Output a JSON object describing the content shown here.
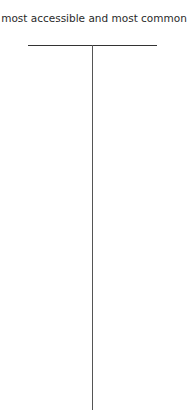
{
  "diagram": {
    "top_label": "most accessible and most common",
    "connectors": [
      {
        "type": "horizontal",
        "from_x": 28,
        "to_x": 157,
        "y": 45
      },
      {
        "type": "vertical",
        "x": 92,
        "from_y": 45,
        "to_y": 410
      }
    ]
  }
}
